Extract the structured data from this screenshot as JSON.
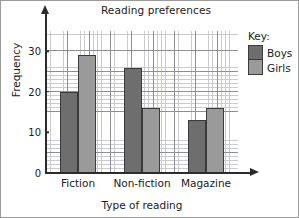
{
  "chart_data": {
    "type": "bar",
    "title": "Reading preferences",
    "xlabel": "Type of reading",
    "ylabel": "Frequency",
    "categories": [
      "Fiction",
      "Non-fiction",
      "Magazine"
    ],
    "series": [
      {
        "name": "Boys",
        "color": "#6e6e6e",
        "values": [
          20,
          26,
          13
        ]
      },
      {
        "name": "Girls",
        "color": "#9a9a9a",
        "values": [
          29,
          16,
          16
        ]
      }
    ],
    "ylim": [
      0,
      35
    ],
    "yticks": [
      0,
      10,
      20,
      30
    ],
    "ytick_labels": [
      "0",
      "10",
      "20",
      "30"
    ],
    "grid": true,
    "grid_major_step": 5,
    "grid_minor_step": 1,
    "legend_title": "Key:",
    "legend_position": "right"
  }
}
